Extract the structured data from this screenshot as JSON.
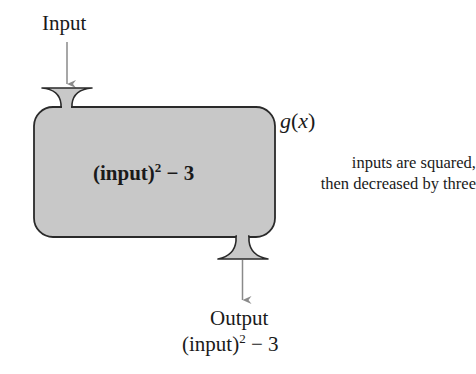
{
  "diagram": {
    "input_label": "Input",
    "function_name": {
      "letter": "g",
      "open_paren": "(",
      "variable": "x",
      "close_paren": ")"
    },
    "description": {
      "line1": "inputs are squared,",
      "line2": "then decreased by three"
    },
    "rule": {
      "base": "(input)",
      "exponent": "2",
      "operation": " − 3"
    },
    "output_label": "Output",
    "output_expression": {
      "base": "(input)",
      "exponent": "2",
      "operation": " − 3"
    },
    "colors": {
      "machine_fill": "#c8c8c8",
      "machine_stroke": "#2a2a2a",
      "arrow": "#8a8a8a",
      "text": "#1a1a1a"
    }
  }
}
